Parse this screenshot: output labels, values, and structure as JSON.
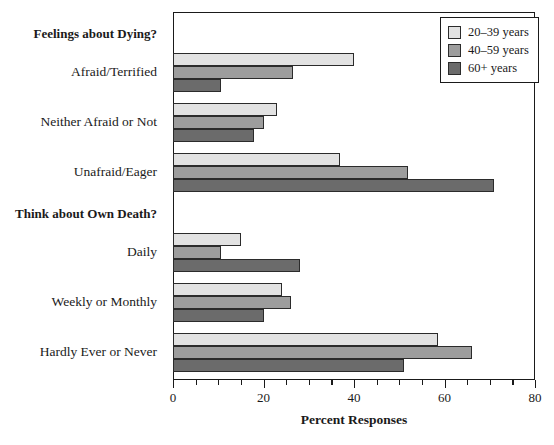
{
  "chart_data": {
    "type": "bar",
    "orientation": "horizontal",
    "title": "",
    "xlabel": "Percent Responses",
    "ylabel": "",
    "xlim": [
      0,
      80
    ],
    "xticks": [
      0,
      20,
      40,
      60,
      80
    ],
    "xtick_labels": [
      "0",
      "20",
      "40",
      "60",
      "80"
    ],
    "minor_tick_step": 5,
    "grid": false,
    "legend_position": "top-right",
    "series": [
      {
        "name": "20–39 years",
        "color": "#e2e2e2",
        "values": [
          40,
          23,
          37,
          15,
          24,
          58.5
        ]
      },
      {
        "name": "40–59 years",
        "color": "#9d9d9d",
        "values": [
          26.5,
          20,
          52,
          10.5,
          26,
          66
        ]
      },
      {
        "name": "60+ years",
        "color": "#6b6b6b",
        "values": [
          10.5,
          18,
          71,
          28,
          20,
          51
        ]
      }
    ],
    "categories": [
      "Afraid/Terrified",
      "Neither Afraid or Not",
      "Unafraid/Eager",
      "Daily",
      "Weekly or Monthly",
      "Hardly Ever or Never"
    ],
    "section_headers": [
      {
        "label": "Feelings about Dying?",
        "before_category_index": 0
      },
      {
        "label": "Think about Own Death?",
        "before_category_index": 3
      }
    ]
  },
  "legend": {
    "items": [
      {
        "label": "20–39 years"
      },
      {
        "label": "40–59 years"
      },
      {
        "label": "60+ years"
      }
    ]
  },
  "axis": {
    "x_title": "Percent Responses",
    "tick_labels": [
      "0",
      "20",
      "40",
      "60",
      "80"
    ]
  }
}
